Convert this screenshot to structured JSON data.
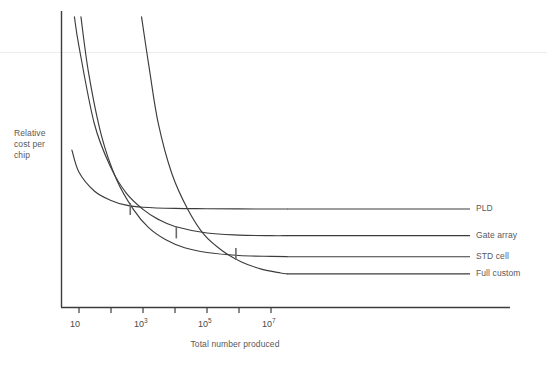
{
  "chart_data": {
    "type": "line",
    "title": "",
    "xlabel": "Total number produced",
    "ylabel": "Relative\ncost per\nchip",
    "ylabel_lines": [
      "Relative",
      "cost per",
      "chip"
    ],
    "x_scale": "log",
    "y_scale": "linear",
    "xlim": [
      10,
      31622776.6
    ],
    "ylim": [
      0,
      1
    ],
    "grid": false,
    "legend_position": "right-inline",
    "x_ticks": [
      {
        "value": 10,
        "label": "10",
        "exponent": "",
        "labeled": true
      },
      {
        "value": 100,
        "label": "",
        "exponent": "",
        "labeled": false
      },
      {
        "value": 1000,
        "label": "10",
        "exponent": "3",
        "labeled": true
      },
      {
        "value": 10000,
        "label": "",
        "exponent": "",
        "labeled": false
      },
      {
        "value": 100000,
        "label": "10",
        "exponent": "5",
        "labeled": true
      },
      {
        "value": 1000000,
        "label": "",
        "exponent": "",
        "labeled": false
      },
      {
        "value": 10000000,
        "label": "10",
        "exponent": "7",
        "labeled": true
      }
    ],
    "series": [
      {
        "name": "PLD",
        "label": "PLD",
        "color": "#3c3c3c",
        "description": "Lowest non-recurring engineering cost; flattens to highest per-chip floor.",
        "points": [
          {
            "x": 6.0,
            "y": 0.53
          },
          {
            "x": 10,
            "y": 0.455
          },
          {
            "x": 30,
            "y": 0.392
          },
          {
            "x": 100,
            "y": 0.36
          },
          {
            "x": 300,
            "y": 0.344
          },
          {
            "x": 1000,
            "y": 0.337
          },
          {
            "x": 10000,
            "y": 0.333
          },
          {
            "x": 100000,
            "y": 0.332
          },
          {
            "x": 10000000,
            "y": 0.331
          },
          {
            "x": 31622776.6,
            "y": 0.331
          }
        ]
      },
      {
        "name": "Gate array",
        "label": "Gate array",
        "color": "#3c3c3c",
        "description": "Moderate NRE cost; flattens to mid per-chip floor.",
        "points": [
          {
            "x": 7.2,
            "y": 0.98
          },
          {
            "x": 10,
            "y": 0.88
          },
          {
            "x": 30,
            "y": 0.62
          },
          {
            "x": 100,
            "y": 0.47
          },
          {
            "x": 300,
            "y": 0.385
          },
          {
            "x": 1000,
            "y": 0.33
          },
          {
            "x": 3000,
            "y": 0.296
          },
          {
            "x": 10000,
            "y": 0.272
          },
          {
            "x": 100000,
            "y": 0.25
          },
          {
            "x": 1000000,
            "y": 0.243
          },
          {
            "x": 10000000,
            "y": 0.241
          },
          {
            "x": 31622776.6,
            "y": 0.241
          }
        ]
      },
      {
        "name": "STD cell",
        "label": "STD cell",
        "color": "#3c3c3c",
        "description": "High NRE cost; flattens to low per-chip floor.",
        "points": [
          {
            "x": 11.5,
            "y": 0.98
          },
          {
            "x": 20,
            "y": 0.79
          },
          {
            "x": 50,
            "y": 0.58
          },
          {
            "x": 150,
            "y": 0.43
          },
          {
            "x": 500,
            "y": 0.33
          },
          {
            "x": 1500,
            "y": 0.268
          },
          {
            "x": 5000,
            "y": 0.228
          },
          {
            "x": 20000,
            "y": 0.2
          },
          {
            "x": 100000,
            "y": 0.184
          },
          {
            "x": 1000000,
            "y": 0.174
          },
          {
            "x": 10000000,
            "y": 0.171
          },
          {
            "x": 31622776.6,
            "y": 0.17
          }
        ]
      },
      {
        "name": "Full custom",
        "label": "Full custom",
        "color": "#3c3c3c",
        "description": "Highest NRE cost, steepest descent; lowest per-chip cost at very high volume.",
        "points": [
          {
            "x": 900,
            "y": 0.98
          },
          {
            "x": 1600,
            "y": 0.8
          },
          {
            "x": 3000,
            "y": 0.62
          },
          {
            "x": 8000,
            "y": 0.45
          },
          {
            "x": 25000,
            "y": 0.33
          },
          {
            "x": 80000,
            "y": 0.245
          },
          {
            "x": 300000,
            "y": 0.19
          },
          {
            "x": 1200000,
            "y": 0.152
          },
          {
            "x": 5000000,
            "y": 0.128
          },
          {
            "x": 20000000,
            "y": 0.115
          },
          {
            "x": 31622776.6,
            "y": 0.112
          }
        ]
      }
    ],
    "crossover_markers": [
      {
        "label": "",
        "x": 400,
        "y": 0.331,
        "between": [
          "PLD",
          "Gate array"
        ]
      },
      {
        "label": "",
        "x": 11000,
        "y": 0.252,
        "between": [
          "Gate array",
          "STD cell"
        ]
      },
      {
        "label": "",
        "x": 800000,
        "y": 0.179,
        "between": [
          "STD cell",
          "Full custom"
        ]
      }
    ]
  }
}
